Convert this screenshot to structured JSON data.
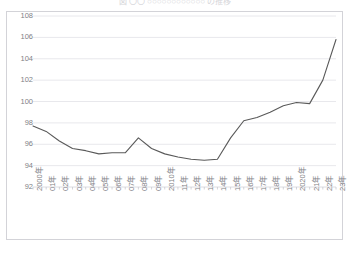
{
  "chart_title": "図 〇〇 ○○○○○○○○○○○○ の推移",
  "chart_data": {
    "type": "line",
    "title": "図 〇〇 ○○○○○○○○○○○○ の推移",
    "xlabel": "",
    "ylabel": "",
    "categories": [
      "2000年",
      "01年",
      "02年",
      "03年",
      "04年",
      "05年",
      "06年",
      "07年",
      "08年",
      "09年",
      "2010年",
      "11年",
      "12年",
      "13年",
      "14年",
      "15年",
      "16年",
      "17年",
      "18年",
      "19年",
      "2020年",
      "21年",
      "22年",
      "23年"
    ],
    "values": [
      97.7,
      97.2,
      96.3,
      95.6,
      95.4,
      95.1,
      95.2,
      95.2,
      96.6,
      95.6,
      95.1,
      94.8,
      94.6,
      94.5,
      94.6,
      96.6,
      98.2,
      98.5,
      99.0,
      99.6,
      99.9,
      99.8,
      102.0,
      105.8
    ],
    "ylim": [
      92,
      108
    ],
    "ytick_labels": [
      "108",
      "106",
      "104",
      "102",
      "100",
      "98",
      "96",
      "94",
      "92"
    ],
    "ytick_values": [
      108,
      106,
      104,
      102,
      100,
      98,
      96,
      94,
      92
    ],
    "grid": true,
    "grid_axis": "y",
    "legend": false,
    "legend_position": "none",
    "series": [
      {
        "name": "指数",
        "color": "#595959",
        "values": [
          97.7,
          97.2,
          96.3,
          95.6,
          95.4,
          95.1,
          95.2,
          95.2,
          96.6,
          95.6,
          95.1,
          94.8,
          94.6,
          94.5,
          94.6,
          96.6,
          98.2,
          98.5,
          99.0,
          99.6,
          99.9,
          99.8,
          102.0,
          105.8
        ]
      }
    ]
  },
  "style": {
    "line_color": "#595959",
    "grid_color": "#e8e8ec",
    "frame_color": "#d3d3d8",
    "tick_text_color": "#7f7f86",
    "plot_background": "#ffffff"
  }
}
